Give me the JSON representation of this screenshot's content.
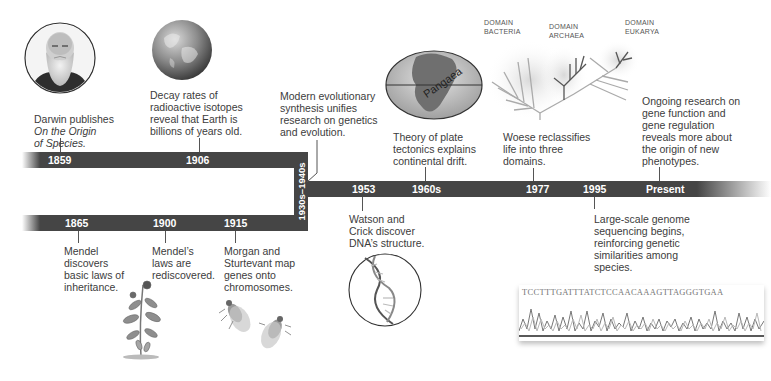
{
  "colors": {
    "bar": "#454545",
    "bar_text": "#ffffff",
    "body_text": "#3c3c3c",
    "background": "#ffffff"
  },
  "events": [
    {
      "year": "1859",
      "track": "upper",
      "text_plain": "Darwin publishes",
      "text_italic": "On the Origin\nof Species.",
      "image": "darwin-portrait"
    },
    {
      "year": "1906",
      "track": "upper",
      "text": "Decay rates of\nradioactive isotopes\nreveal that Earth is\nbillions of years old.",
      "image": "earth-globe"
    },
    {
      "year": "1930s–1940s",
      "track": "connector",
      "text": "Modern evolutionary\nsynthesis unifies\nresearch on genetics\nand evolution."
    },
    {
      "year": "1865",
      "track": "lower",
      "text": "Mendel\ndiscovers\nbasic laws of\ninheritance.",
      "image": "pea-plant"
    },
    {
      "year": "1900",
      "track": "lower",
      "text": "Mendel’s\nlaws are\nrediscovered."
    },
    {
      "year": "1915",
      "track": "lower",
      "text": "Morgan and\nSturtevant map\ngenes onto\nchromosomes.",
      "image": "fruit-flies"
    },
    {
      "year": "1953",
      "track": "main-below",
      "text": "Watson and\nCrick discover\nDNA’s structure.",
      "image": "dna-helix"
    },
    {
      "year": "1960s",
      "track": "main-above",
      "text": "Theory of plate\ntectonics explains\ncontinental drift.",
      "image": "pangaea-map",
      "image_label": "Pangaea"
    },
    {
      "year": "1977",
      "track": "main-above",
      "text": "Woese reclassifies\nlife into three\ndomains.",
      "image": "tree-of-life"
    },
    {
      "year": "1995",
      "track": "main-below",
      "text": "Large-scale genome\nsequencing begins,\nreinforcing genetic\nsimilarities among\nspecies.",
      "image": "sequence-chromatogram"
    },
    {
      "year": "Present",
      "track": "main-above",
      "text": "Ongoing research on\ngene function and\ngene regulation\nreveals more about\nthe origin of new\nphenotypes."
    }
  ],
  "tree_labels": {
    "bacteria": "DOMAIN\nBACTERIA",
    "archaea": "DOMAIN\nARCHAEA",
    "eukarya": "DOMAIN\nEUKARYA"
  },
  "sequence": "TCCTTTGATTTATCTCCAACAAAGTTAGGGTGAA"
}
